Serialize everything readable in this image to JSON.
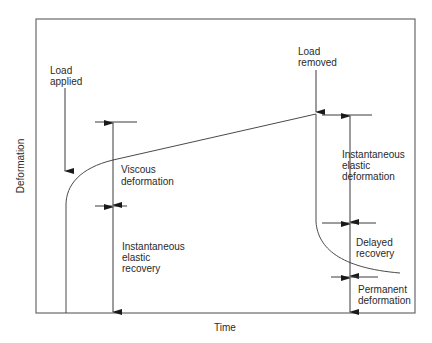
{
  "axes": {
    "x_label": "Time",
    "y_label": "Deformation"
  },
  "annotations": {
    "load_applied": [
      "Load",
      "applied"
    ],
    "load_removed": [
      "Load",
      "removed"
    ],
    "viscous_deformation": [
      "Viscous",
      "deformation"
    ],
    "instantaneous_elastic_recovery": [
      "Instantaneous",
      "elastic",
      "recovery"
    ],
    "instantaneous_elastic_deformation": [
      "Instantaneous",
      "elastic",
      "deformation"
    ],
    "delayed_recovery": [
      "Delayed",
      "recovery"
    ],
    "permanent_deformation": [
      "Permanent",
      "deformation"
    ]
  },
  "colors": {
    "line": "#3a3a3a",
    "frame": "#6a6a6a",
    "background": "#ffffff"
  }
}
